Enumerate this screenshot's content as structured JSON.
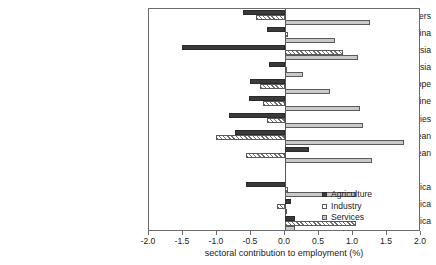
{
  "chart_data": {
    "type": "bar",
    "orientation": "horizontal",
    "title": "",
    "xlabel": "sectoral contribution to employment (%)",
    "ylabel": "",
    "xlim": [
      -2.0,
      2.0
    ],
    "xticks": [
      -2.0,
      -1.5,
      -1.0,
      -0.5,
      0.0,
      0.5,
      1.0,
      1.5,
      2.0
    ],
    "xticklabels": [
      "-2.0",
      "-1.5",
      "-1.0",
      "-0.5",
      "0.0",
      "0.5",
      "1.0",
      "1.5",
      "2.0"
    ],
    "grid": false,
    "legend_position": "lower right",
    "categories": [
      "Tigers",
      "China",
      "Southeast Asia",
      "South Asia",
      "Central & Eastern Europe",
      "Russia & Ukraine",
      "Semi-industrialized countries",
      "Central America & the Caribbean",
      "Andean",
      "",
      "Representative Africa",
      "Other Africa",
      "Middle East & Northern Africa"
    ],
    "series": [
      {
        "name": "Agriculture",
        "color": "#3a3a3a",
        "values": [
          -0.62,
          -0.27,
          -1.52,
          -0.24,
          -0.52,
          -0.53,
          -0.83,
          -0.74,
          0.35,
          null,
          -0.58,
          0.09,
          0.14
        ]
      },
      {
        "name": "Industry",
        "color": "#ffffff",
        "pattern": "hatched",
        "values": [
          -0.43,
          0.04,
          0.85,
          0.0,
          -0.37,
          -0.33,
          -0.27,
          -1.02,
          -0.58,
          null,
          0.05,
          -0.12,
          1.05
        ]
      },
      {
        "name": "Services",
        "color": "#c9c9c9",
        "values": [
          1.25,
          0.73,
          1.08,
          0.27,
          0.66,
          1.11,
          1.15,
          1.75,
          1.28,
          null,
          1.04,
          0.02,
          0.15
        ]
      }
    ]
  },
  "legend": {
    "entries": [
      {
        "label": "Agriculture"
      },
      {
        "label": "Industry"
      },
      {
        "label": "Services"
      }
    ]
  }
}
